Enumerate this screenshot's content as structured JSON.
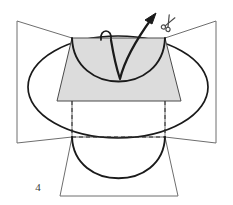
{
  "figure": {
    "caption_number": "4",
    "background_color": "#ffffff",
    "stroke_color": "#1a1a1a",
    "thin_stroke_color": "#555555",
    "shaded_fill_color": "#dcdcdc",
    "label_color": "#3a3a3a",
    "dash_color": "#2b2b2b"
  },
  "elements": {
    "left_wing": {
      "name": "left-panel-wing",
      "points": "17,21 72,38 72,137 17,143",
      "stroke": "#6e6e6e",
      "fill": "none"
    },
    "right_wing": {
      "name": "right-panel-wing",
      "points": "216,21 165,38 165,137 216,143",
      "stroke": "#6e6e6e",
      "fill": "none"
    },
    "oval": {
      "name": "outer-oval-outline",
      "cx": 118,
      "cy": 87,
      "rx": 90,
      "ry": 51,
      "stroke": "#1a1a1a",
      "fill": "none"
    },
    "shaded_trapezoid": {
      "name": "shaded-flap-trapezoid",
      "points": "72,38 165,38 181,101 57,101",
      "fill": "#dcdcdc",
      "stroke": "#4a4a4a"
    },
    "inner_bowl_arc": {
      "name": "inner-bowl-arc",
      "path": "M 72,38 C 74,96 163,96 165,38",
      "stroke": "#1a1a1a"
    },
    "dashed_left": {
      "name": "dashed-fold-line-left",
      "x1": 72,
      "y1": 101,
      "x2": 72,
      "y2": 137
    },
    "dashed_right": {
      "name": "dashed-fold-line-right",
      "x1": 165,
      "y1": 101,
      "x2": 165,
      "y2": 137
    },
    "dashed_bottom": {
      "name": "dashed-fold-line-bottom",
      "x1": 72,
      "y1": 137,
      "x2": 165,
      "y2": 137
    },
    "bottom_trapezoid": {
      "name": "bottom-flap-trapezoid",
      "points": "72,137 165,137 178,196 60,196",
      "stroke": "#6e6e6e",
      "fill": "none"
    },
    "bottom_arc": {
      "name": "bottom-semicircle-arc",
      "path": "M 72,137 C 74,192 163,192 165,137",
      "stroke": "#1a1a1a"
    },
    "thread_loop": {
      "name": "thread-loop",
      "path": "M 101,40 C 99,28 113,28 111,40",
      "stroke": "#1a1a1a"
    },
    "thread_v": {
      "name": "thread-v-stitch",
      "path": "M 111,40 C 114,58 117,70 120,79 C 124,62 136,40 152,18",
      "stroke": "#1a1a1a"
    },
    "thread_arrow": {
      "name": "thread-direction-arrow",
      "points": "156,13 145,20 152,24",
      "stroke": "#1a1a1a",
      "fill": "#1a1a1a"
    },
    "scissors": {
      "name": "scissors-icon",
      "cx": 169,
      "cy": 22,
      "stroke": "#4a4a4a"
    },
    "label_4": {
      "name": "figure-number-label",
      "text": "4",
      "x": 38,
      "y": 191
    }
  }
}
